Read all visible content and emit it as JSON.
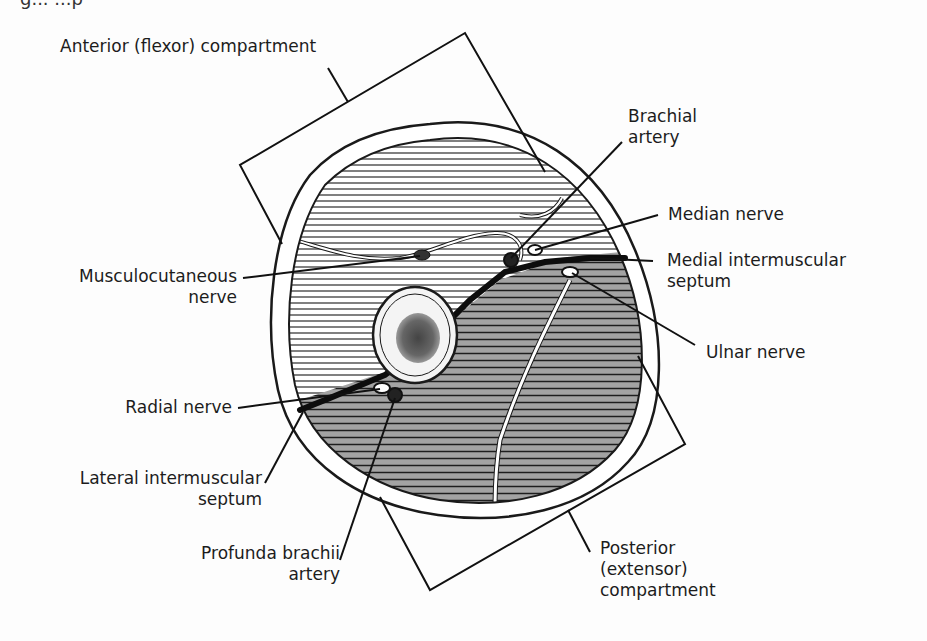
{
  "figure": {
    "caption_fragment": "g...    ...p"
  },
  "labels": {
    "anterior": "Anterior (flexor) compartment",
    "brachial_1": "Brachial",
    "brachial_2": "artery",
    "median": "Median nerve",
    "medial_septum_1": "Medial intermuscular",
    "medial_septum_2": "septum",
    "musculo_1": "Musculocutaneous",
    "musculo_2": "nerve",
    "ulnar": "Ulnar nerve",
    "radial": "Radial nerve",
    "lateral_septum_1": "Lateral intermuscular",
    "lateral_septum_2": "septum",
    "profunda_1": "Profunda brachii",
    "profunda_2": "artery",
    "posterior_1": "Posterior",
    "posterior_2": "(extensor)",
    "posterior_3": "compartment"
  },
  "colors": {
    "ink": "#1a1a1a",
    "anterior_hatch_bg": "#ffffff",
    "posterior_hatch_bg": "#9a9a9a",
    "page": "#fdfdfd"
  }
}
